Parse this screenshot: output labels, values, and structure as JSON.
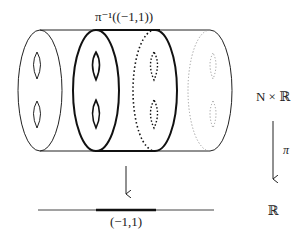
{
  "diagram": {
    "type": "fibration-figure",
    "labels": {
      "preimage": "π⁻¹((−1,1))",
      "total_space": "N × ℝ",
      "projection": "π",
      "base": "ℝ",
      "interval": "(−1,1)"
    },
    "elements": [
      {
        "name": "cylinder",
        "description": "N × ℝ drawn as a horizontal cylinder whose cross-sections are genus-2 surfaces"
      },
      {
        "name": "fiber-left",
        "style": "solid thin"
      },
      {
        "name": "fiber-preimage-left-boundary",
        "style": "solid thick"
      },
      {
        "name": "fiber-preimage-right-boundary",
        "style": "dotted thick"
      },
      {
        "name": "fiber-right",
        "style": "dotted light"
      },
      {
        "name": "projection-arrow-right",
        "label": "π"
      },
      {
        "name": "projection-arrow-center"
      },
      {
        "name": "real-line",
        "highlight": "(−1,1)"
      }
    ],
    "colors": {
      "ink": "#222222",
      "light_ink": "#9a9a9a"
    }
  }
}
